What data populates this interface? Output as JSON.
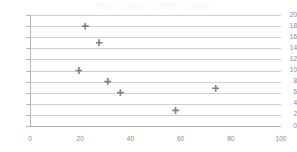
{
  "chart_data": {
    "type": "scatter",
    "title": "",
    "xlabel": "",
    "ylabel": "",
    "xlim": [
      0,
      100
    ],
    "ylim": [
      0,
      20
    ],
    "grid": true,
    "legend": null,
    "marker_color": "#808080",
    "gridline_color": "#d0d0d0",
    "axis_color": "#b5b5b5",
    "tick_label_color": "#8a8a8a",
    "x_ticks": [
      0,
      20,
      40,
      60,
      80,
      100
    ],
    "x_tick_labels": [
      "0",
      "20",
      "40",
      "60",
      "80",
      "100"
    ],
    "y_ticks": [
      0,
      2,
      4,
      6,
      8,
      10,
      12,
      14,
      16,
      18,
      20
    ],
    "y_tick_labels": [
      "0",
      "2",
      "4",
      "6",
      "8",
      "10",
      "12",
      "14",
      "16",
      "18",
      "20"
    ],
    "points": [
      {
        "x": 22.0,
        "y": 18.0
      },
      {
        "x": 27.5,
        "y": 15.0
      },
      {
        "x": 19.5,
        "y": 10.0
      },
      {
        "x": 31.0,
        "y": 8.0
      },
      {
        "x": 36.0,
        "y": 6.0
      },
      {
        "x": 74.0,
        "y": 6.8
      },
      {
        "x": 58.0,
        "y": 2.8
      }
    ]
  }
}
